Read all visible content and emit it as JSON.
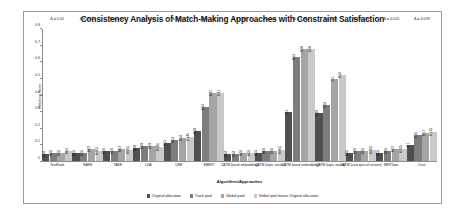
{
  "chart_data": {
    "type": "bar",
    "title": "Consistency Analysis of Match-Making Approaches with Constraint Satisfaction",
    "xlabel": "Algorithms/Approaches",
    "ylabel": "Matching Score",
    "ylim": [
      0,
      0.8
    ],
    "yticks": [
      "0",
      "0.1",
      "0.2",
      "0.3",
      "0.4",
      "0.5",
      "0.6",
      "0.7",
      "0.8"
    ],
    "grid": false,
    "legend_position": "bottom",
    "series": [
      {
        "name": "Original allocation",
        "color": "#4f4f4f",
        "values": [
          0.04,
          0.05,
          0.06,
          0.08,
          0.11,
          0.18,
          0.04,
          0.05,
          0.3,
          0.29,
          0.05,
          0.05,
          0.1
        ]
      },
      {
        "name": "Track pool",
        "color": "#7d7d7d",
        "values": [
          0.05,
          0.05,
          0.06,
          0.09,
          0.13,
          0.33,
          0.04,
          0.06,
          0.63,
          0.34,
          0.06,
          0.06,
          0.16
        ]
      },
      {
        "name": "Global pool",
        "color": "#a5a5a5",
        "values": [
          0.05,
          0.07,
          0.07,
          0.09,
          0.14,
          0.41,
          0.05,
          0.06,
          0.68,
          0.5,
          0.06,
          0.07,
          0.17
        ]
      },
      {
        "name": "Global pool minus Original allocation",
        "color": "#c9c9c9",
        "values": [
          0.06,
          0.063,
          0.065,
          0.085,
          0.145,
          0.41,
          0.05,
          0.065,
          0.68,
          0.52,
          0.065,
          0.075,
          0.175
        ]
      }
    ],
    "categories": [
      "TextRank",
      "RAKE",
      "YAKE",
      "LDA",
      "USE",
      "SBERT",
      "CATM (word embedding)",
      "CATM (topic vector)",
      "CATM (word embedding)",
      "CATM (topic vector)",
      "CATM (concepts of vectors)",
      "BERTopic",
      "Ours"
    ],
    "group_annotations": [
      "Δ = 0.02",
      "Δ = 0.013",
      "Δ = 0.005",
      "Δ = 0.05",
      "Δ = 0.04",
      "Δ = 0.07",
      "Δ = 0.06",
      "Δ = 0.01",
      "Δ = 0.48",
      "Δ = 0.26",
      "Δ = 0.015",
      "Δ = 0.025",
      "Δ = 0.078"
    ],
    "bar_labels": [
      [
        "0.04",
        "0.05",
        "0.05",
        "0.06"
      ],
      [
        "0.05",
        "0.05",
        "0.07",
        "0.063"
      ],
      [
        "0.06",
        "0.06",
        "0.07",
        "0.065"
      ],
      [
        "0.08",
        "0.09",
        "0.09",
        "0.085"
      ],
      [
        "0.11",
        "0.13",
        "0.14",
        "0.145"
      ],
      [
        "0.18",
        "0.33",
        "0.41",
        "0.41"
      ],
      [
        "0.04",
        "0.04",
        "0.05",
        "0.05"
      ],
      [
        "0.05",
        "0.06",
        "0.06",
        "0.065"
      ],
      [
        "0.3",
        "0.63",
        "0.68",
        "0.68"
      ],
      [
        "0.29",
        "0.34",
        "0.5",
        "0.52"
      ],
      [
        "0.05",
        "0.06",
        "0.06",
        "0.065"
      ],
      [
        "0.05",
        "0.06",
        "0.07",
        "0.075"
      ],
      [
        "0.1",
        "0.16",
        "0.17",
        "0.175"
      ]
    ]
  }
}
